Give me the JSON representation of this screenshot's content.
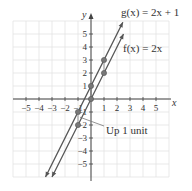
{
  "chart_data": {
    "type": "line",
    "title": "",
    "xlabel": "x",
    "ylabel": "y",
    "xlim": [
      -6,
      6
    ],
    "ylim": [
      -6,
      6
    ],
    "grid": true,
    "x_ticks": [
      -5,
      -4,
      -3,
      -2,
      -1,
      1,
      2,
      3,
      4,
      5
    ],
    "y_ticks": [
      -5,
      -4,
      -3,
      -2,
      -1,
      1,
      2,
      3,
      4,
      5
    ],
    "x_tick_labels": [
      "−5",
      "−4",
      "−3",
      "−2",
      "−1",
      "1",
      "2",
      "3",
      "4",
      "5"
    ],
    "y_tick_labels": [
      "−5",
      "−4",
      "−3",
      "−2",
      "−1",
      "1",
      "2",
      "3",
      "4",
      "5"
    ],
    "series": [
      {
        "name": "f(x) = 2x",
        "slope": 2,
        "intercept": 0,
        "points": [
          [
            -1,
            -2
          ],
          [
            0,
            0
          ],
          [
            1,
            2
          ]
        ],
        "color": "#555555"
      },
      {
        "name": "g(x) = 2x + 1",
        "slope": 2,
        "intercept": 1,
        "points": [
          [
            -1,
            -1
          ],
          [
            0,
            1
          ],
          [
            1,
            3
          ]
        ],
        "color": "#555555"
      }
    ],
    "annotations": [
      {
        "text": "Up 1 unit",
        "points_to": [
          -1,
          -1.5
        ]
      },
      {
        "text": "g(x) = 2x + 1",
        "near": "top of g line"
      },
      {
        "text": "f(x) = 2x",
        "near": "top of f line"
      }
    ]
  },
  "labels": {
    "g": "g(x) = 2x + 1",
    "f": "f(x) = 2x",
    "shift": "Up 1 unit",
    "x_axis": "x",
    "y_axis": "y"
  }
}
